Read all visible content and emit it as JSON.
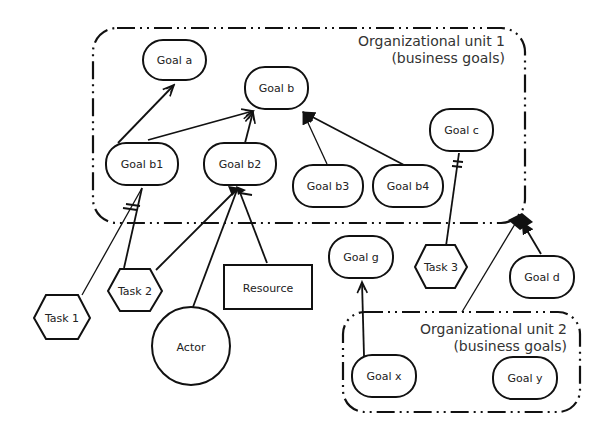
{
  "diagram": {
    "units": [
      {
        "id": "unit1",
        "title": "Organizational unit 1",
        "subtitle": "(business goals)"
      },
      {
        "id": "unit2",
        "title": "Organizational unit 2",
        "subtitle": "(business goals)"
      }
    ],
    "goals": {
      "a": "Goal a",
      "b": "Goal b",
      "b1": "Goal b1",
      "b2": "Goal b2",
      "b3": "Goal b3",
      "b4": "Goal b4",
      "c": "Goal c",
      "d": "Goal d",
      "g": "Goal g",
      "x": "Goal x",
      "y": "Goal y"
    },
    "tasks": {
      "t1": "Task 1",
      "t2": "Task 2",
      "t3": "Task 3"
    },
    "resource": "Resource",
    "actor": "Actor",
    "edges": [
      {
        "from": "Goal b1",
        "to": "Goal a",
        "type": "open-arrow"
      },
      {
        "from": "Goal b1",
        "to": "Goal b",
        "type": "open-arrow"
      },
      {
        "from": "Goal b2",
        "to": "Goal b",
        "type": "open-arrow"
      },
      {
        "from": "Goal b3",
        "to": "Goal b",
        "type": "filled-arrow"
      },
      {
        "from": "Goal b4",
        "to": "Goal b",
        "type": "filled-arrow"
      },
      {
        "from": "Task 1",
        "to": "Goal b1",
        "type": "means-end"
      },
      {
        "from": "Task 2",
        "to": "Goal b1",
        "type": "line"
      },
      {
        "from": "Task 2",
        "to": "Goal b2",
        "type": "line"
      },
      {
        "from": "Actor",
        "to": "Goal b2",
        "type": "line"
      },
      {
        "from": "Resource",
        "to": "Goal b2",
        "type": "line"
      },
      {
        "from": "Task 3",
        "to": "Goal c",
        "type": "means-end"
      },
      {
        "from": "Goal d",
        "to": "Organizational unit 1",
        "type": "filled-arrow"
      },
      {
        "from": "Organizational unit 2",
        "to": "Organizational unit 1",
        "type": "filled-arrow"
      },
      {
        "from": "Goal x",
        "to": "Goal g",
        "type": "open-arrow"
      }
    ]
  }
}
